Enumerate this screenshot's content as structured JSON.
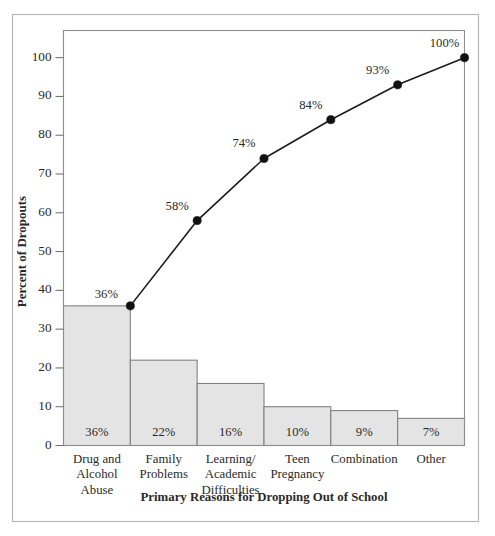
{
  "chart_data": {
    "type": "bar",
    "title": "",
    "xlabel": "Primary Reasons for Dropping Out of School",
    "ylabel": "Percent of Dropouts",
    "categories": [
      "Drug and Alcohol Abuse",
      "Family Problems",
      "Learning/ Academic Difficulties",
      "Teen Pregnancy",
      "Combination",
      "Other"
    ],
    "category_lines": [
      [
        "Drug and",
        "Alcohol",
        "Abuse"
      ],
      [
        "Family",
        "Problems"
      ],
      [
        "Learning/",
        "Academic",
        "Difficulties"
      ],
      [
        "Teen",
        "Pregnancy"
      ],
      [
        "Combination"
      ],
      [
        "Other"
      ]
    ],
    "values": [
      36,
      22,
      16,
      10,
      9,
      7
    ],
    "bar_value_labels": [
      "36%",
      "22%",
      "16%",
      "10%",
      "9%",
      "7%"
    ],
    "series": [
      {
        "name": "Percent of Dropouts",
        "values": [
          36,
          22,
          16,
          10,
          9,
          7
        ]
      },
      {
        "name": "Cumulative Percent",
        "values": [
          36,
          58,
          74,
          84,
          93,
          100
        ],
        "labels": [
          "36%",
          "58%",
          "74%",
          "84%",
          "93%",
          "100%"
        ]
      }
    ],
    "ylim": [
      0,
      107
    ],
    "yticks": [
      0,
      10,
      20,
      30,
      40,
      50,
      60,
      70,
      80,
      90,
      100
    ],
    "ytick_labels": [
      "0",
      "10",
      "20",
      "30",
      "40",
      "50",
      "60",
      "70",
      "80",
      "90",
      "100"
    ],
    "grid": false,
    "legend": "none",
    "colors": {
      "bar_fill": "#e4e4e4",
      "bar_stroke": "#7d7d7d",
      "line": "#1c1c1c",
      "marker": "#111111",
      "frame": "#8e8e8e",
      "outer_frame": "#b9b9b9",
      "text": "#2a2a2a",
      "background": "#ffffff"
    }
  }
}
